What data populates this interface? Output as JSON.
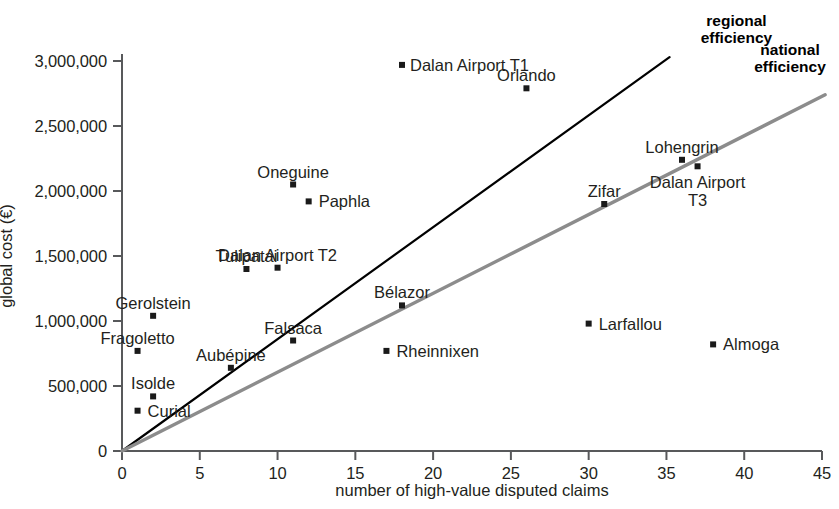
{
  "chart_data": {
    "type": "scatter",
    "title": "",
    "xlabel": "number of high-value disputed claims",
    "ylabel": "global cost (€)",
    "xlim": [
      0,
      45
    ],
    "ylim": [
      0,
      3000000
    ],
    "grid": false,
    "legend_position": "inline-annotations",
    "xticks": [
      "0",
      "5",
      "10",
      "15",
      "20",
      "25",
      "30",
      "35",
      "40",
      "45"
    ],
    "xtick_values": [
      0,
      5,
      10,
      15,
      20,
      25,
      30,
      35,
      40,
      45
    ],
    "yticks": [
      "0",
      "500,000",
      "1,000,000",
      "1,500,000",
      "2,000,000",
      "2,500,000",
      "3,000,000"
    ],
    "ytick_values": [
      0,
      500000,
      1000000,
      1500000,
      2000000,
      2500000,
      3000000
    ],
    "marker_color": "#1a1a1a",
    "points": [
      {
        "label": "Curial",
        "x": 1,
        "y": 310000,
        "label_dx": 10,
        "label_dy": 0,
        "align": "left"
      },
      {
        "label": "Isolde",
        "x": 2,
        "y": 420000,
        "label_dx": 0,
        "label_dy": -17,
        "align": "center"
      },
      {
        "label": "Fragoletto",
        "x": 1,
        "y": 770000,
        "label_dx": 0,
        "label_dy": -17,
        "align": "center"
      },
      {
        "label": "Aubépine",
        "x": 7,
        "y": 640000,
        "label_dx": 0,
        "label_dy": -17,
        "align": "center"
      },
      {
        "label": "Gerolstein",
        "x": 2,
        "y": 1040000,
        "label_dx": 0,
        "label_dy": -17,
        "align": "center"
      },
      {
        "label": "Falsaca",
        "x": 11,
        "y": 850000,
        "label_dx": 0,
        "label_dy": -17,
        "align": "center"
      },
      {
        "label": "Tulipatai",
        "x": 8,
        "y": 1400000,
        "label_dx": 0,
        "label_dy": -17,
        "align": "center"
      },
      {
        "label": "Dalan Airport T2",
        "x": 10,
        "y": 1410000,
        "label_dx": 0,
        "label_dy": -17,
        "align": "center"
      },
      {
        "label": "Oneguine",
        "x": 11,
        "y": 2050000,
        "label_dx": 0,
        "label_dy": -17,
        "align": "center"
      },
      {
        "label": "Paphla",
        "x": 12,
        "y": 1920000,
        "label_dx": 10,
        "label_dy": 0,
        "align": "left"
      },
      {
        "label": "Bélazor",
        "x": 18,
        "y": 1120000,
        "label_dx": 0,
        "label_dy": -17,
        "align": "center"
      },
      {
        "label": "Rheinnixen",
        "x": 17,
        "y": 770000,
        "label_dx": 10,
        "label_dy": 0,
        "align": "left"
      },
      {
        "label": "Dalan Airport T1",
        "x": 18,
        "y": 2970000,
        "label_dx": 8,
        "label_dy": 0,
        "align": "left"
      },
      {
        "label": "Orlando",
        "x": 26,
        "y": 2790000,
        "label_dx": 0,
        "label_dy": -17,
        "align": "center"
      },
      {
        "label": "Zifar",
        "x": 31,
        "y": 1900000,
        "label_dx": 0,
        "label_dy": -17,
        "align": "center"
      },
      {
        "label": "Lohengrin",
        "x": 36,
        "y": 2240000,
        "label_dx": 0,
        "label_dy": -17,
        "align": "center"
      },
      {
        "label": "Dalan Airport\nT3",
        "x": 37,
        "y": 2190000,
        "label_dx": 0,
        "label_dy": 14,
        "align": "center"
      },
      {
        "label": "Larfallou",
        "x": 30,
        "y": 980000,
        "label_dx": 10,
        "label_dy": 0,
        "align": "left"
      },
      {
        "label": "Almoga",
        "x": 38,
        "y": 820000,
        "label_dx": 10,
        "label_dy": 0,
        "align": "left"
      }
    ],
    "trend_lines": [
      {
        "name": "regional efficiency",
        "label": "regional\nefficiency",
        "color": "#000000",
        "width": 2.2,
        "x_start": 0,
        "y_start": 0,
        "x_end": 35.2,
        "y_end": 3030000,
        "label_x": 39.5,
        "label_y": 3300000
      },
      {
        "name": "national efficiency",
        "label": "national\nefficiency",
        "color": "#8c8c8c",
        "width": 3.4,
        "x_start": 0,
        "y_start": 0,
        "x_end": 45.2,
        "y_end": 2740000,
        "label_x": 49.5,
        "label_y": 3080000
      }
    ]
  }
}
